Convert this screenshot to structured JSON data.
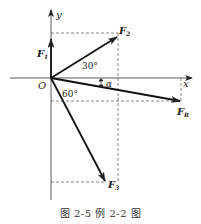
{
  "figure": {
    "caption": "图 2-5   例 2-2 图",
    "axes": {
      "x_label": "x",
      "y_label": "y",
      "origin_label": "O"
    },
    "forces": [
      {
        "name": "F1",
        "label_main": "F",
        "label_sub": "1",
        "direction": "along +y"
      },
      {
        "name": "F2",
        "label_main": "F",
        "label_sub": "2",
        "angle_label": "30°",
        "direction": "30° above +x"
      },
      {
        "name": "F3",
        "label_main": "F",
        "label_sub": "3",
        "angle_label": "60°",
        "direction": "60° below +x"
      },
      {
        "name": "FR",
        "label_main": "F",
        "label_sub": "R",
        "angle_label": "α",
        "direction": "resultant, α below +x"
      }
    ],
    "angles": {
      "f2_angle": "30°",
      "f3_angle": "60°",
      "resultant_angle": "α"
    },
    "colors": {
      "line": "#222222",
      "dashed": "#555555",
      "text": "#222222"
    }
  }
}
